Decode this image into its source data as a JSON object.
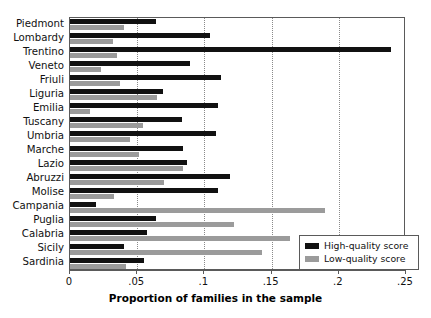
{
  "chart_data": {
    "type": "bar",
    "orientation": "horizontal",
    "title": "",
    "subtitle": "",
    "xlabel": "Proportion of families in the sample",
    "ylabel": "",
    "xlim": [
      0,
      0.25
    ],
    "xticks": [
      0,
      0.05,
      0.1,
      0.15,
      0.2,
      0.25
    ],
    "xtick_labels": [
      "0",
      ".05",
      ".1",
      ".15",
      ".2",
      ".25"
    ],
    "grid": "vertical-dotted",
    "legend_position": "bottom-right",
    "categories": [
      "Piedmont",
      "Lombardy",
      "Trentino",
      "Veneto",
      "Friuli",
      "Liguria",
      "Emilia",
      "Tuscany",
      "Umbria",
      "Marche",
      "Lazio",
      "Abruzzi",
      "Molise",
      "Campania",
      "Puglia",
      "Calabria",
      "Sicily",
      "Sardinia"
    ],
    "series": [
      {
        "name": "High-quality score",
        "color": "#111111",
        "values": [
          0.064,
          0.104,
          0.239,
          0.089,
          0.112,
          0.069,
          0.11,
          0.083,
          0.109,
          0.084,
          0.087,
          0.119,
          0.11,
          0.019,
          0.064,
          0.057,
          0.04,
          0.055
        ]
      },
      {
        "name": "Low-quality score",
        "color": "#9b9b9b",
        "values": [
          0.04,
          0.032,
          0.035,
          0.023,
          0.037,
          0.065,
          0.015,
          0.054,
          0.045,
          0.051,
          0.084,
          0.07,
          0.033,
          0.19,
          0.122,
          0.164,
          0.143,
          0.042
        ]
      }
    ]
  },
  "legend": {
    "items": [
      {
        "label": "High-quality score",
        "color": "#111111"
      },
      {
        "label": "Low-quality score",
        "color": "#9b9b9b"
      }
    ]
  }
}
